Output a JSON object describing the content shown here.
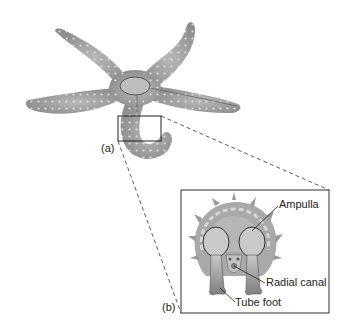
{
  "figure": {
    "panel_a": {
      "label": "(a)",
      "subject": "sea star (starfish), oral-view illustration with enlarged region outlined"
    },
    "panel_b": {
      "label": "(b)",
      "subject": "cross-section of sea star arm showing water vascular system",
      "callouts": [
        {
          "id": "ampulla",
          "text": "Ampulla"
        },
        {
          "id": "radial-canal",
          "text": "Radial canal"
        },
        {
          "id": "tube-foot",
          "text": "Tube foot"
        }
      ]
    },
    "colors": {
      "body_fill": "#9a9a9a",
      "body_light": "#c4c4c4",
      "outline": "#333333",
      "background": "#ffffff",
      "spine": "#d8d8d8"
    }
  }
}
